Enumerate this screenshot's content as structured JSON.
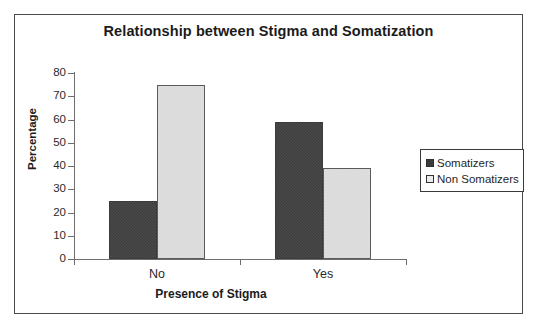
{
  "chart_data": {
    "type": "bar",
    "title": "Relationship between Stigma and Somatization",
    "xlabel": "Presence of Stigma",
    "ylabel": "Percentage",
    "categories": [
      "No",
      "Yes"
    ],
    "series": [
      {
        "name": "Somatizers",
        "values": [
          25,
          59
        ],
        "color": "#3b3b3b"
      },
      {
        "name": "Non Somatizers",
        "values": [
          75,
          39
        ],
        "color": "#e1e1e1"
      }
    ],
    "ylim": [
      0,
      80
    ],
    "ytick_step": 10,
    "yticks": [
      "80",
      "70",
      "60",
      "50",
      "40",
      "30",
      "20",
      "10",
      "0"
    ],
    "grid": false,
    "legend_position": "right"
  },
  "legend": {
    "entries": [
      {
        "label": "Somatizers"
      },
      {
        "label": "Non Somatizers"
      }
    ]
  },
  "axes": {
    "y_title": "Percentage",
    "x_title": "Presence of Stigma"
  }
}
